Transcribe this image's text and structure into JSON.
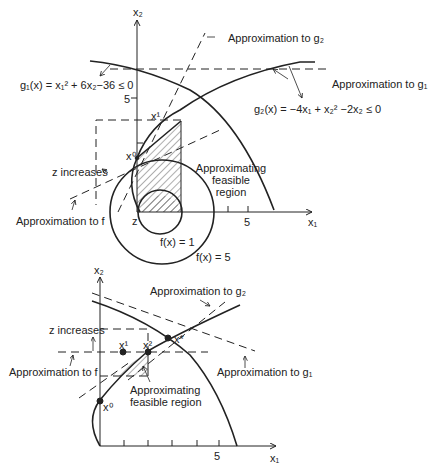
{
  "top_diagram": {
    "axis_x_label": "x₁",
    "axis_y_label": "x₂",
    "tick_x_5": "5",
    "tick_y_5": "5",
    "g1_label": "g₁(x) = x₁² + 6x₂−36 ≤ 0",
    "g2_label": "g₂(x) = −4x₁ + x₂² −2x₂ ≤ 0",
    "approx_g1": "Approximation to g₁",
    "approx_g2": "Approximation to g₂",
    "approx_f": "Approximation to f",
    "z_increases": "z increases",
    "approx_region_line1": "Approximating",
    "approx_region_line2": "feasible",
    "approx_region_line3": "region",
    "x0": "x⁰",
    "x1": "x¹",
    "z": "z",
    "f1": "f(x) = 1",
    "f5": "f(x) = 5"
  },
  "bottom_diagram": {
    "axis_x_label": "x₁",
    "axis_y_label": "x₂",
    "tick_x_5": "5",
    "approx_g1": "Approximation to g₁",
    "approx_g2": "Approximation to g₂",
    "approx_f": "Approximation to f",
    "z_increases": "z increases",
    "approx_region_line1": "Approximating",
    "approx_region_line2": "feasible region",
    "x0": "x⁰",
    "x1": "x¹",
    "x2": "x²",
    "xstar": "x*"
  }
}
